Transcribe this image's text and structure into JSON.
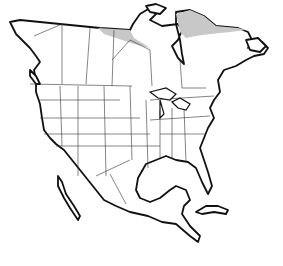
{
  "map": {
    "type": "outline map",
    "region": "North America",
    "shows": [
      "Canada provinces/territories",
      "United States states",
      "Mexico",
      "Cuba"
    ],
    "shaded_regions": [
      {
        "name": "northern Canada band (Nunavut/Northwest Territories edge)",
        "color": "#c8c8c8"
      },
      {
        "name": "northern Quebec / Ungava",
        "color": "#c8c8c8"
      }
    ],
    "colors": {
      "land": "#ffffff",
      "outline": "#111111",
      "borders": "#333333",
      "shade": "#c8c8c8"
    }
  }
}
